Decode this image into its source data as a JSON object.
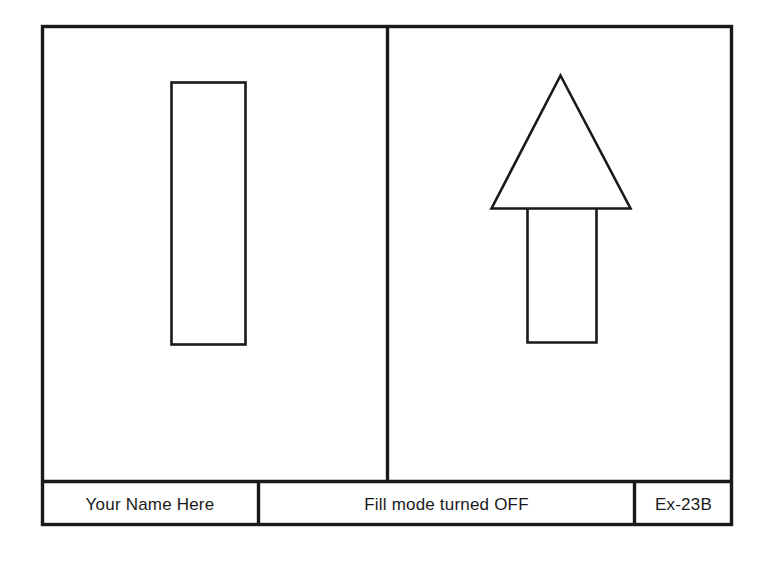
{
  "drawing": {
    "border_color": "#1a1a1a",
    "background_color": "#ffffff",
    "line_color": "#1a1a1a"
  },
  "views": {
    "left": {
      "name": "front-view",
      "shape": "rectangle",
      "fill": "none"
    },
    "right": {
      "name": "arrow-view",
      "shape": "arrow-up",
      "fill": "none"
    }
  },
  "title_block": {
    "name_cell": "Your Name Here",
    "title_cell": "Fill mode turned OFF",
    "number_cell": "Ex-23B"
  }
}
